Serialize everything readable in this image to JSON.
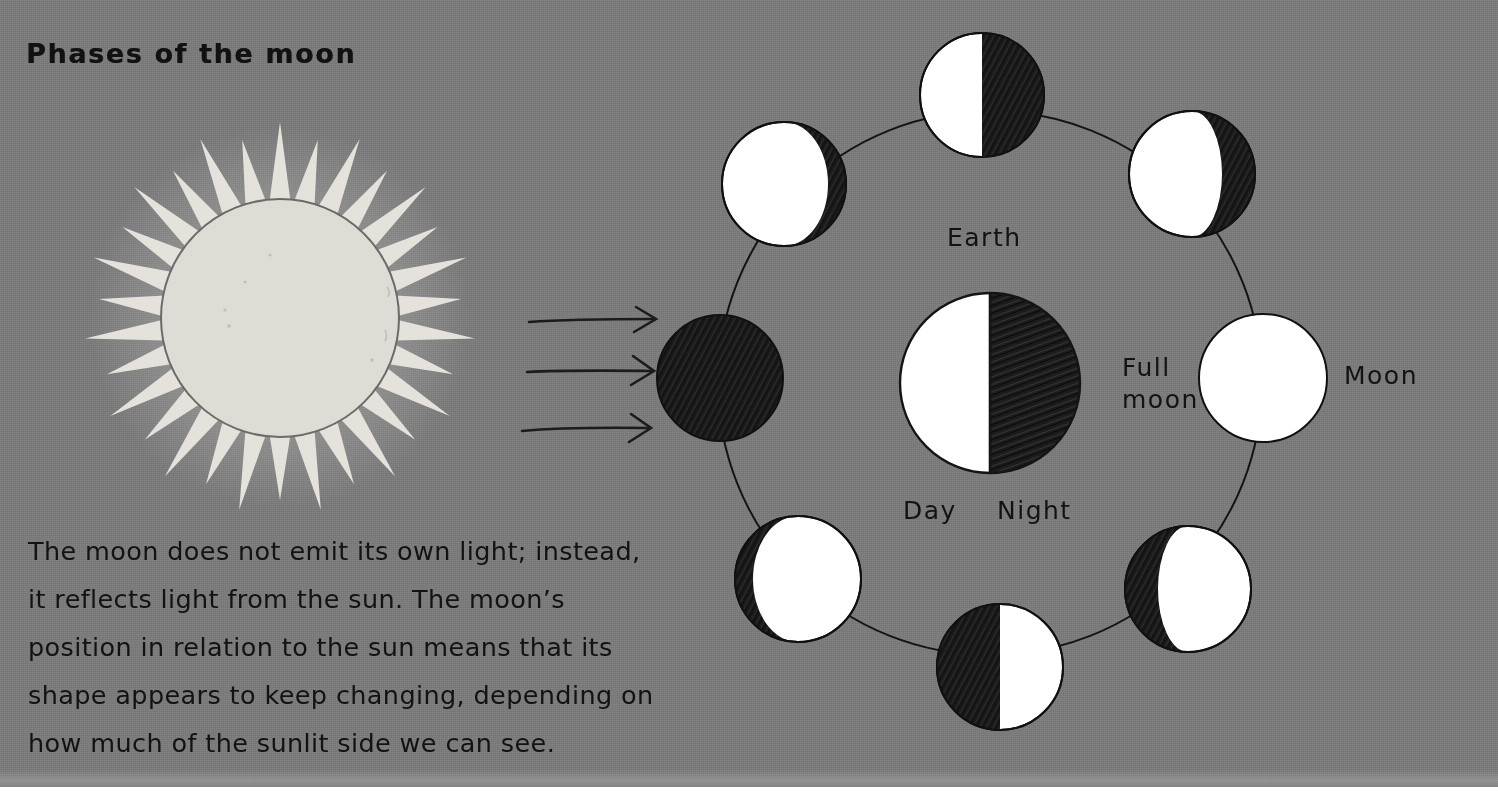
{
  "page": {
    "title": "Phases of the moon",
    "background_color": "#7b7b7b",
    "ink_color": "#121212",
    "lit_color": "#ffffff",
    "dark_color": "#1d1d1d",
    "sun_color": "#dedcd4"
  },
  "body_text": {
    "lines": [
      "The moon does not emit its own light; instead,",
      "it reflects light from the sun. The moon’s",
      "position in relation to the sun means that its",
      "shape appears to keep changing, depending on",
      "how much of the sunlit side we can see."
    ]
  },
  "labels": {
    "earth": "Earth",
    "day": "Day",
    "night": "Night",
    "full_moon_line1": "Full",
    "full_moon_line2": "moon",
    "moon": "Moon"
  },
  "diagram": {
    "sun": {
      "cx": 280,
      "cy": 318,
      "radius": 119,
      "ray_count": 30,
      "ray_outer": 196
    },
    "sunlight_arrows": [
      {
        "x1": 529,
        "y1": 322,
        "x2": 655,
        "y2": 319
      },
      {
        "x1": 527,
        "y1": 372,
        "x2": 652,
        "y2": 371
      },
      {
        "x1": 522,
        "y1": 431,
        "x2": 650,
        "y2": 428
      }
    ],
    "orbit": {
      "cx": 990,
      "cy": 383,
      "radius": 272
    },
    "earth": {
      "cx": 990,
      "cy": 383,
      "radius": 90,
      "lit_side": "left"
    },
    "moons": [
      {
        "name": "new-moon",
        "cx": 720,
        "cy": 378,
        "radius": 63,
        "phase": "new",
        "lit_fraction": 0.0,
        "terminator_offset": 0
      },
      {
        "name": "waxing-crescent",
        "cx": 784,
        "cy": 184,
        "radius": 62,
        "phase": "waxing-crescent",
        "lit_fraction": 0.15,
        "lit_side": "left"
      },
      {
        "name": "first-quarter",
        "cx": 982,
        "cy": 95,
        "radius": 62,
        "phase": "first-quarter",
        "lit_fraction": 0.5,
        "lit_side": "left"
      },
      {
        "name": "waxing-gibbous",
        "cx": 1192,
        "cy": 174,
        "radius": 63,
        "phase": "waxing-gibbous",
        "lit_fraction": 0.82,
        "lit_side": "left"
      },
      {
        "name": "full-moon",
        "cx": 1263,
        "cy": 378,
        "radius": 64,
        "phase": "full",
        "lit_fraction": 1.0
      },
      {
        "name": "waning-gibbous",
        "cx": 1188,
        "cy": 589,
        "radius": 63,
        "phase": "waning-gibbous",
        "lit_fraction": 0.82,
        "lit_side": "right"
      },
      {
        "name": "last-quarter",
        "cx": 1000,
        "cy": 667,
        "radius": 63,
        "phase": "last-quarter",
        "lit_fraction": 0.5,
        "lit_side": "right"
      },
      {
        "name": "waning-crescent",
        "cx": 798,
        "cy": 579,
        "radius": 63,
        "phase": "waning-crescent",
        "lit_fraction": 0.18,
        "lit_side": "right"
      }
    ]
  }
}
